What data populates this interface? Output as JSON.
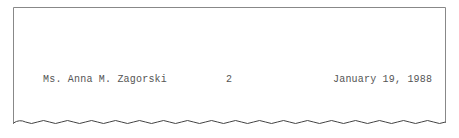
{
  "header": {
    "recipient": "Ms. Anna M. Zagorski",
    "page_number": "2",
    "date": "January 19, 1988"
  },
  "colors": {
    "border": "#777777",
    "text": "#555555",
    "background": "#ffffff"
  }
}
